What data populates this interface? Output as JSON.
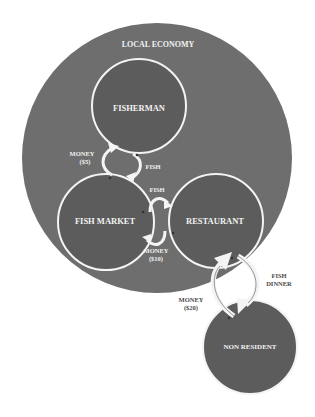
{
  "colors": {
    "background": "#ffffff",
    "outer_circle": "#6e6e6e",
    "inner_circle": "#5c5c5c",
    "outline": "#f4f4f4",
    "label_on_dark": "#f2f2f2",
    "label_on_light": "#4a4a4a"
  },
  "regions": {
    "local_economy": {
      "label": "LOCAL ECONOMY"
    }
  },
  "nodes": {
    "fisherman": {
      "label": "FISHERMAN"
    },
    "fish_market": {
      "label": "FISH MARKET"
    },
    "restaurant": {
      "label": "RESTAURANT"
    },
    "non_resident": {
      "label": "NON RESIDENT"
    }
  },
  "flows": {
    "fisherman_market": {
      "money_line1": "MONEY",
      "money_line2": "($5)",
      "goods": "FISH"
    },
    "market_restaurant": {
      "goods": "FISH",
      "money_line1": "MONEY",
      "money_line2": "($10)"
    },
    "restaurant_nonresident": {
      "money_line1": "MONEY",
      "money_line2": "($20)",
      "goods_line1": "FISH",
      "goods_line2": "DINNER"
    }
  }
}
